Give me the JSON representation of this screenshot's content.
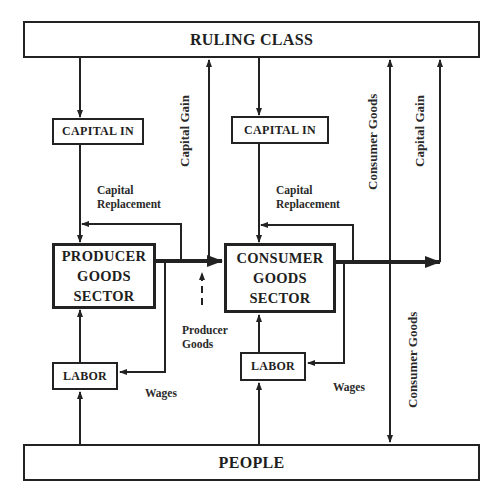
{
  "diagram": {
    "nodes": {
      "ruling_class": "RULING CLASS",
      "people": "PEOPLE",
      "capital_in_producer": "CAPITAL IN",
      "capital_in_consumer": "CAPITAL IN",
      "producer_sector": [
        "PRODUCER",
        "GOODS",
        "SECTOR"
      ],
      "consumer_sector": [
        "CONSUMER",
        "GOODS",
        "SECTOR"
      ],
      "labor_producer": "LABOR",
      "labor_consumer": "LABOR"
    },
    "edge_labels": {
      "capital_replacement_left": [
        "Capital",
        "Replacement"
      ],
      "capital_replacement_right": [
        "Capital",
        "Replacement"
      ],
      "capital_gain_left": "Capital Gain",
      "capital_gain_right": "Capital Gain",
      "consumer_goods_upper": "Consumer Goods",
      "consumer_goods_lower": "Consumer Goods",
      "producer_goods": [
        "Producer",
        "Goods"
      ],
      "wages_left": "Wages",
      "wages_right": "Wages"
    },
    "line_color": "#222222"
  }
}
